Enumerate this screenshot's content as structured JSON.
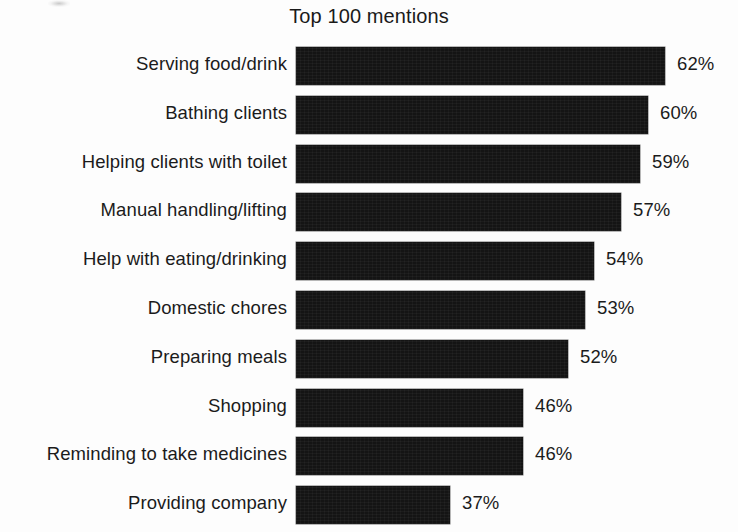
{
  "chart_data": {
    "type": "bar",
    "orientation": "horizontal",
    "title": "Top 100 mentions",
    "xlabel": "",
    "ylabel": "",
    "grid": false,
    "legend": false,
    "value_suffix": "%",
    "categories": [
      "Serving food/drink",
      "Bathing clients",
      "Helping clients with toilet",
      "Manual handling/lifting",
      "Help with eating/drinking",
      "Domestic chores",
      "Preparing meals",
      "Shopping",
      "Reminding to take medicines",
      "Providing company"
    ],
    "values": [
      62,
      60,
      59,
      57,
      54,
      53,
      52,
      46,
      46,
      37
    ],
    "value_labels": [
      "62%",
      "60%",
      "59%",
      "57%",
      "54%",
      "53%",
      "52%",
      "46%",
      "46%",
      "37%"
    ],
    "bar_pixel_lengths": [
      369,
      352,
      344,
      325,
      298,
      289,
      272,
      227,
      227,
      154
    ],
    "xlim": [
      0,
      100
    ],
    "colors": {
      "bar": "#141414",
      "text": "#1b1b1b",
      "background": "#fdfdfd"
    }
  },
  "layout": {
    "bar_left_px": 296,
    "row_pitch_px": 48.8,
    "bar_height_px": 38,
    "value_gap_px": 12
  }
}
